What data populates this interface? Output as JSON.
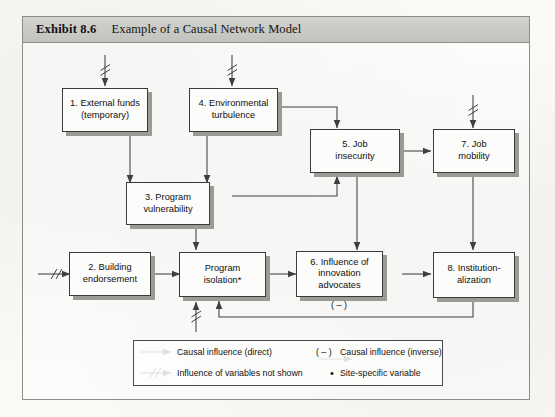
{
  "exhibit": {
    "label": "Exhibit 8.6",
    "title": "Example of a Causal Network Model"
  },
  "nodes": [
    {
      "id": "n1",
      "label": "1. External funds\n(temporary)",
      "line1": "1. External funds",
      "line2": "(temporary)"
    },
    {
      "id": "n4",
      "label": "4. Environmental\nturbulence",
      "line1": "4. Environmental",
      "line2": "turbulence"
    },
    {
      "id": "n5",
      "label": "5. Job\ninsecurity",
      "line1": "5. Job",
      "line2": "insecurity"
    },
    {
      "id": "n7",
      "label": "7. Job\nmobility",
      "line1": "7. Job",
      "line2": "mobility"
    },
    {
      "id": "n3",
      "label": "3. Program\nvulnerability",
      "line1": "3. Program",
      "line2": "vulnerability"
    },
    {
      "id": "n2",
      "label": "2. Building\nendorsement",
      "line1": "2. Building",
      "line2": "endorsement"
    },
    {
      "id": "niso",
      "label": "Program\nisolation*",
      "line1": "Program",
      "line2": "isolation*"
    },
    {
      "id": "n6",
      "label": "6. Influence of\ninnovation\nadvocates",
      "line1": "6. Influence of",
      "line2": "innovation",
      "line3": "advocates"
    },
    {
      "id": "n8",
      "label": "8. Institution-\nalization",
      "line1": "8. Institution-",
      "line2": "alization"
    }
  ],
  "annotations": {
    "inverse_marker": "( – )"
  },
  "legend": {
    "items": [
      {
        "symbol": "arrow",
        "text": "Causal influence (direct)"
      },
      {
        "symbol": "minus-arrow",
        "prefix": "( – )",
        "text": "Causal influence (inverse)"
      },
      {
        "symbol": "slash-arrow",
        "text": "Influence of variables not shown"
      },
      {
        "symbol": "dot",
        "prefix": "•",
        "text": "Site-specific variable"
      }
    ],
    "direct_label": "Causal influence (direct)",
    "inverse_prefix": "( – )",
    "inverse_label": "Causal influence (inverse)",
    "notshown_label": "Influence of variables not shown",
    "sitespecific_prefix": "•",
    "sitespecific_label": "Site-specific variable"
  },
  "colors": {
    "frame_border": "#8c8c8c",
    "titlebar_bg": "#c9c9c6",
    "box_border": "#3a3a3a",
    "box_fill": "#fcfcfa",
    "box_shadow": "#9a9a97",
    "line": "#3f3f3f",
    "paper": "#fbfaf7"
  }
}
